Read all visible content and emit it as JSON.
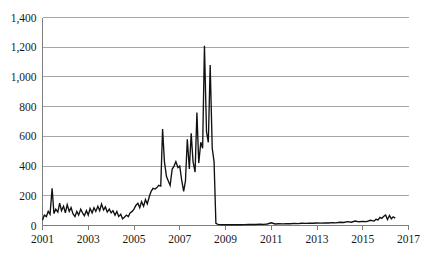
{
  "chart_data": {
    "type": "line",
    "title": "",
    "subtitle": "",
    "xlabel": "",
    "ylabel": "",
    "xlim": [
      2001,
      2017
    ],
    "ylim": [
      0,
      1400
    ],
    "grid": true,
    "grid_axis": "y",
    "legend": false,
    "legend_position": "none",
    "colors": {
      "series": "#111111",
      "gridline": "#a6a6a6",
      "axis": "#7f7f7f",
      "background": "#ffffff",
      "text": "#1a1a1a"
    },
    "ytick_labels": [
      "0",
      "200",
      "400",
      "600",
      "800",
      "1,000",
      "1,200",
      "1,400"
    ],
    "ytick_values": [
      0,
      200,
      400,
      600,
      800,
      1000,
      1200,
      1400
    ],
    "xtick_labels": [
      "2001",
      "2003",
      "2005",
      "2007",
      "2009",
      "2011",
      "2013",
      "2015",
      "2017"
    ],
    "xtick_values": [
      2001,
      2003,
      2005,
      2007,
      2009,
      2011,
      2013,
      2015,
      2017
    ],
    "series": [
      {
        "name": "series-1",
        "x": [
          2001.0,
          2001.08,
          2001.17,
          2001.25,
          2001.33,
          2001.42,
          2001.5,
          2001.58,
          2001.67,
          2001.75,
          2001.83,
          2001.92,
          2002.0,
          2002.08,
          2002.17,
          2002.25,
          2002.33,
          2002.42,
          2002.5,
          2002.58,
          2002.67,
          2002.75,
          2002.83,
          2002.92,
          2003.0,
          2003.08,
          2003.17,
          2003.25,
          2003.33,
          2003.42,
          2003.5,
          2003.58,
          2003.67,
          2003.75,
          2003.83,
          2003.92,
          2004.0,
          2004.08,
          2004.17,
          2004.25,
          2004.33,
          2004.42,
          2004.5,
          2004.58,
          2004.67,
          2004.75,
          2004.83,
          2004.92,
          2005.0,
          2005.08,
          2005.17,
          2005.25,
          2005.33,
          2005.42,
          2005.5,
          2005.58,
          2005.67,
          2005.75,
          2005.83,
          2005.92,
          2006.0,
          2006.08,
          2006.17,
          2006.25,
          2006.33,
          2006.42,
          2006.5,
          2006.58,
          2006.67,
          2006.75,
          2006.83,
          2006.92,
          2007.0,
          2007.08,
          2007.17,
          2007.25,
          2007.33,
          2007.42,
          2007.5,
          2007.58,
          2007.67,
          2007.75,
          2007.83,
          2007.92,
          2008.0,
          2008.08,
          2008.17,
          2008.25,
          2008.33,
          2008.42,
          2008.5,
          2008.58,
          2008.67,
          2008.75,
          2008.83,
          2008.92,
          2009.0,
          2009.17,
          2009.33,
          2009.5,
          2009.67,
          2009.83,
          2010.0,
          2010.17,
          2010.33,
          2010.5,
          2010.67,
          2010.83,
          2011.0,
          2011.17,
          2011.33,
          2011.5,
          2011.67,
          2011.83,
          2012.0,
          2012.17,
          2012.33,
          2012.5,
          2012.67,
          2012.83,
          2013.0,
          2013.17,
          2013.33,
          2013.5,
          2013.67,
          2013.83,
          2014.0,
          2014.17,
          2014.33,
          2014.5,
          2014.67,
          2014.83,
          2015.0,
          2015.17,
          2015.33,
          2015.5,
          2015.58,
          2015.67,
          2015.75,
          2015.83,
          2015.92,
          2016.0,
          2016.08,
          2016.17,
          2016.25,
          2016.33,
          2016.42
        ],
        "values": [
          35,
          70,
          60,
          95,
          75,
          250,
          80,
          110,
          90,
          150,
          100,
          130,
          85,
          140,
          95,
          120,
          80,
          60,
          95,
          70,
          110,
          85,
          65,
          100,
          70,
          115,
          85,
          120,
          95,
          130,
          100,
          145,
          105,
          125,
          90,
          110,
          85,
          100,
          70,
          95,
          60,
          75,
          45,
          55,
          70,
          60,
          85,
          95,
          110,
          135,
          150,
          120,
          160,
          130,
          175,
          145,
          195,
          230,
          250,
          245,
          255,
          270,
          265,
          650,
          430,
          330,
          300,
          270,
          380,
          400,
          430,
          390,
          400,
          310,
          230,
          300,
          580,
          380,
          620,
          430,
          360,
          760,
          420,
          560,
          520,
          1210,
          630,
          560,
          1080,
          520,
          430,
          15,
          8,
          6,
          5,
          5,
          5,
          6,
          5,
          6,
          5,
          6,
          7,
          8,
          7,
          9,
          8,
          10,
          18,
          10,
          12,
          11,
          13,
          12,
          14,
          13,
          15,
          14,
          16,
          15,
          17,
          16,
          18,
          17,
          19,
          18,
          22,
          20,
          26,
          22,
          30,
          25,
          28,
          26,
          35,
          30,
          42,
          38,
          55,
          48,
          62,
          70,
          40,
          68,
          45,
          58,
          50
        ]
      }
    ]
  }
}
